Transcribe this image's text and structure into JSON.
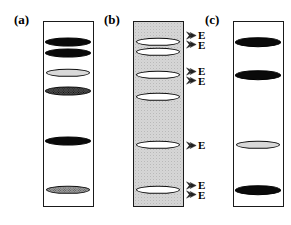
{
  "figure": {
    "background_color": "#ffffff",
    "panels": [
      {
        "id": "a",
        "label": "(a)",
        "label_x": 14,
        "label_y": 12,
        "box": {
          "x": 43,
          "y": 21,
          "width": 51,
          "height": 186
        },
        "shaded": false,
        "shade_color": "#ffffff",
        "bands": [
          {
            "name": "band-a-1",
            "cx": 68,
            "cy": 42,
            "rx": 23,
            "ry": 4.5,
            "fill": "fill-black"
          },
          {
            "name": "band-a-2",
            "cx": 68,
            "cy": 53,
            "rx": 23,
            "ry": 4.5,
            "fill": "fill-black"
          },
          {
            "name": "band-a-3",
            "cx": 68,
            "cy": 73,
            "rx": 22,
            "ry": 4.2,
            "fill": "fill-light"
          },
          {
            "name": "band-a-4",
            "cx": 68,
            "cy": 91,
            "rx": 23,
            "ry": 4.5,
            "fill": "fill-dark-hatch"
          },
          {
            "name": "band-a-5",
            "cx": 68,
            "cy": 141,
            "rx": 23,
            "ry": 4.5,
            "fill": "fill-black"
          },
          {
            "name": "band-a-6",
            "cx": 68,
            "cy": 190,
            "rx": 22,
            "ry": 4.2,
            "fill": "fill-gray-hatch"
          }
        ],
        "markers": []
      },
      {
        "id": "b",
        "label": "(b)",
        "label_x": 104,
        "label_y": 12,
        "box": {
          "x": 133,
          "y": 21,
          "width": 51,
          "height": 186
        },
        "shaded": true,
        "shade_color": "#d6d6d6",
        "bands": [
          {
            "name": "band-b-1",
            "cx": 158,
            "cy": 42,
            "rx": 22,
            "ry": 4.2,
            "fill": "fill-white"
          },
          {
            "name": "band-b-2",
            "cx": 158,
            "cy": 52,
            "rx": 22,
            "ry": 4.2,
            "fill": "fill-white"
          },
          {
            "name": "band-b-3",
            "cx": 158,
            "cy": 75,
            "rx": 22,
            "ry": 4.2,
            "fill": "fill-white"
          },
          {
            "name": "band-b-4",
            "cx": 158,
            "cy": 97,
            "rx": 22,
            "ry": 4.2,
            "fill": "fill-white"
          },
          {
            "name": "band-b-5",
            "cx": 158,
            "cy": 145,
            "rx": 22,
            "ry": 4.2,
            "fill": "fill-white"
          },
          {
            "name": "band-b-6",
            "cx": 158,
            "cy": 190,
            "rx": 22,
            "ry": 4.2,
            "fill": "fill-white"
          }
        ],
        "markers": [
          {
            "name": "marker-b-top",
            "x": 186,
            "y": 40,
            "arrows": 2,
            "letters": [
              "E",
              "E"
            ]
          },
          {
            "name": "marker-b-upper",
            "x": 186,
            "y": 76,
            "arrows": 2,
            "letters": [
              "E",
              "E"
            ]
          },
          {
            "name": "marker-b-middle",
            "x": 186,
            "y": 145,
            "arrows": 1,
            "letters": [
              "E"
            ]
          },
          {
            "name": "marker-b-bottom",
            "x": 186,
            "y": 190,
            "arrows": 2,
            "letters": [
              "E",
              "E"
            ]
          }
        ]
      },
      {
        "id": "c",
        "label": "(c)",
        "label_x": 205,
        "label_y": 12,
        "box": {
          "x": 233,
          "y": 21,
          "width": 51,
          "height": 186
        },
        "shaded": false,
        "shade_color": "#ffffff",
        "bands": [
          {
            "name": "band-c-1",
            "cx": 258,
            "cy": 42,
            "rx": 23,
            "ry": 4.8,
            "fill": "fill-black"
          },
          {
            "name": "band-c-2",
            "cx": 258,
            "cy": 75,
            "rx": 23,
            "ry": 4.8,
            "fill": "fill-black"
          },
          {
            "name": "band-c-3",
            "cx": 258,
            "cy": 145,
            "rx": 22,
            "ry": 4.2,
            "fill": "fill-light"
          },
          {
            "name": "band-c-4",
            "cx": 258,
            "cy": 190,
            "rx": 23,
            "ry": 4.8,
            "fill": "fill-black"
          }
        ],
        "markers": []
      }
    ]
  }
}
